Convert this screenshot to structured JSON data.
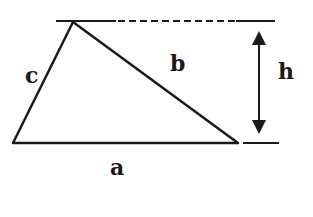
{
  "diagram": {
    "type": "triangle-with-height",
    "labels": {
      "a": "a",
      "b": "b",
      "c": "c",
      "h": "h"
    },
    "vertices": {
      "top": [
        73,
        22
      ],
      "bottom_left": [
        13,
        143
      ],
      "bottom_right": [
        238,
        143
      ]
    },
    "colors": {
      "stroke": "#1a1a1a",
      "background": "#ffffff"
    }
  }
}
